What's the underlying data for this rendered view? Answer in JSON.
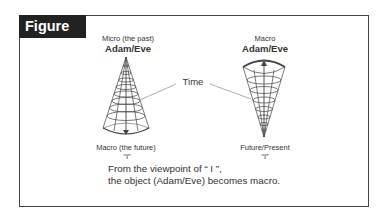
{
  "figure": {
    "title": "Figure 16"
  },
  "left_cone": {
    "top_label": "Micro (the past)",
    "top_name": "Adam/Eve",
    "bottom_label": "Macro (the future)",
    "bottom_name": "“I”",
    "orientation": "apex-up",
    "arrow_direction": "down"
  },
  "right_cone": {
    "top_label": "Macro",
    "top_name": "Adam/Eve",
    "bottom_label": "Future/Present",
    "bottom_name": "“I”",
    "orientation": "apex-down",
    "arrow_direction": "up"
  },
  "time_label": "Time",
  "caption": {
    "line1": "From the viewpoint of “ I ”,",
    "line2": "the object (Adam/Eve) becomes macro."
  },
  "colors": {
    "header_bg": "#222222",
    "line": "#444444",
    "text": "#333333"
  }
}
